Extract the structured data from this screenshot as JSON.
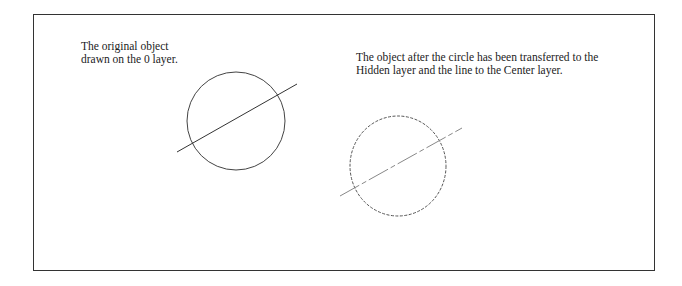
{
  "left_panel": {
    "caption_lines": [
      "The original object",
      "drawn on the 0 layer."
    ],
    "circle": {
      "cx": 236,
      "cy": 121,
      "r": 49,
      "linetype": "continuous"
    },
    "line": {
      "x1": 177,
      "y1": 152,
      "x2": 297,
      "y2": 84,
      "linetype": "continuous"
    }
  },
  "right_panel": {
    "caption_lines": [
      "The object after the circle has been transferred to the",
      "Hidden layer and the line to the Center layer."
    ],
    "circle": {
      "cx": 398,
      "cy": 166,
      "rx": 48,
      "ry": 50,
      "linetype": "hidden (dashed)"
    },
    "line": {
      "x1": 340,
      "y1": 196,
      "x2": 462,
      "y2": 128,
      "linetype": "center (dash-dot)"
    }
  },
  "colors": {
    "stroke": "#444444",
    "center_line": "#888888",
    "frame": "#333333",
    "text": "#222222"
  }
}
